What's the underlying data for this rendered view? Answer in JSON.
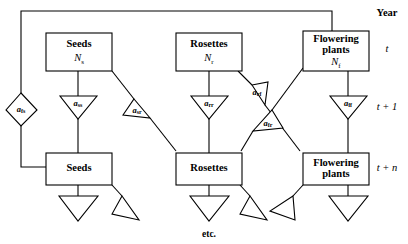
{
  "figure": {
    "title_column": "Year",
    "etc_note": "etc."
  },
  "year_rows": [
    {
      "id": "year-t",
      "label": "t"
    },
    {
      "id": "year-t-plus-1",
      "label": "t + 1"
    },
    {
      "id": "year-t-plus-n",
      "label": "t + n"
    }
  ],
  "stages_top": [
    {
      "id": "seeds-t",
      "name": "Seeds",
      "line2": "",
      "var_base": "N",
      "var_sub": "s"
    },
    {
      "id": "rosettes-t",
      "name": "Rosettes",
      "line2": "",
      "var_base": "N",
      "var_sub": "r"
    },
    {
      "id": "flowering-plants-t",
      "name": "Flowering",
      "line2": "plants",
      "var_base": "N",
      "var_sub": "f"
    }
  ],
  "stages_bottom": [
    {
      "id": "seeds-t-n",
      "name": "Seeds",
      "line2": ""
    },
    {
      "id": "rosettes-t-n",
      "name": "Rosettes",
      "line2": ""
    },
    {
      "id": "flowering-plants-t-n",
      "name": "Flowering",
      "line2": "plants"
    }
  ],
  "coefficients": [
    {
      "id": "a-fs",
      "base": "a",
      "sub": "fs",
      "shape": "diamond",
      "from": "flowering-plants-t",
      "to": "seeds-t-n"
    },
    {
      "id": "a-ss",
      "base": "a",
      "sub": "ss",
      "shape": "triangle-down",
      "from": "seeds-t",
      "to": "seeds-t-n"
    },
    {
      "id": "a-sr",
      "base": "a",
      "sub": "sr",
      "shape": "triangle-right",
      "from": "seeds-t",
      "to": "rosettes-t-n"
    },
    {
      "id": "a-rr",
      "base": "a",
      "sub": "rr",
      "shape": "triangle-down",
      "from": "rosettes-t",
      "to": "rosettes-t-n"
    },
    {
      "id": "a-rf",
      "base": "a",
      "sub": "rf",
      "shape": "triangle-left",
      "from": "rosettes-t",
      "to": "flowering-plants-t-n"
    },
    {
      "id": "a-fr",
      "base": "a",
      "sub": "fr",
      "shape": "triangle-right",
      "from": "flowering-plants-t",
      "to": "rosettes-t-n"
    },
    {
      "id": "a-ff",
      "base": "a",
      "sub": "ff",
      "shape": "triangle-down",
      "from": "flowering-plants-t",
      "to": "flowering-plants-t-n"
    }
  ],
  "outflows": [
    {
      "id": "outflow-seeds-down",
      "shape": "triangle-down"
    },
    {
      "id": "outflow-seeds-right",
      "shape": "triangle-right"
    },
    {
      "id": "outflow-rosettes-down",
      "shape": "triangle-down"
    },
    {
      "id": "outflow-rosettes-right",
      "shape": "triangle-right"
    },
    {
      "id": "outflow-flowering-left",
      "shape": "triangle-left"
    },
    {
      "id": "outflow-flowering-down",
      "shape": "triangle-down"
    }
  ],
  "colors": {
    "stroke": "#000000",
    "fill": "#ffffff",
    "background": "#ffffff"
  }
}
